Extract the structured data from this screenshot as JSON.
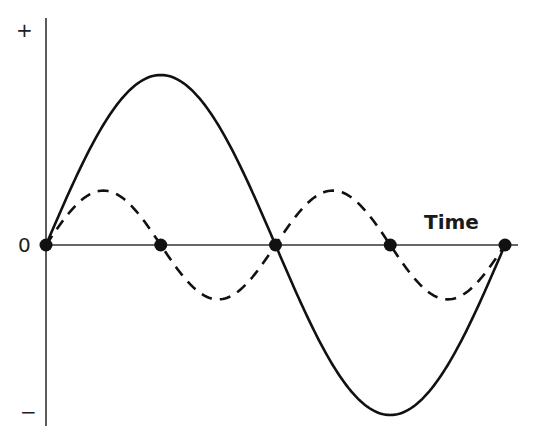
{
  "chart_data": {
    "type": "line",
    "title": "",
    "xlabel": "Time",
    "ylabel": "",
    "y_tick_labels": [
      "+",
      "0",
      "−"
    ],
    "x_tick_labels": [],
    "grid": false,
    "legend": null,
    "x_units": "fraction of one full period of the solid wave",
    "x": [
      0,
      0.25,
      0.5,
      0.75,
      1.0
    ],
    "series": [
      {
        "name": "solid wave (fundamental)",
        "style": "solid",
        "color": "#111111",
        "amplitude": 1.0,
        "cycles": 1,
        "values": [
          0,
          1,
          0,
          -1,
          0
        ]
      },
      {
        "name": "dashed wave (second harmonic)",
        "style": "dashed",
        "color": "#111111",
        "amplitude": 0.32,
        "cycles": 2,
        "values": [
          0,
          0.32,
          0,
          -0.32,
          0
        ]
      }
    ],
    "markers": {
      "description": "filled dots on the zero line at shared zero crossings",
      "x": [
        0,
        0.25,
        0.5,
        0.75,
        1.0
      ],
      "y": [
        0,
        0,
        0,
        0,
        0
      ]
    }
  },
  "labels": {
    "plus": "+",
    "zero": "0",
    "minus": "−",
    "time": "Time"
  }
}
